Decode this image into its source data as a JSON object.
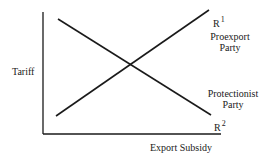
{
  "diagram": {
    "type": "line-diagram",
    "y_axis_label": "Tariff",
    "x_axis_label": "Export Subsidy",
    "lines": [
      {
        "id": "R1",
        "label_base": "R",
        "label_sup": "1",
        "description": [
          "Proexport",
          "Party"
        ],
        "direction": "ascending"
      },
      {
        "id": "R2",
        "label_base": "R",
        "label_sup": "2",
        "description": [
          "Protectionist",
          "Party"
        ],
        "direction": "descending"
      }
    ],
    "colors": {
      "line": "#1a1a1a",
      "background": "#ffffff"
    }
  }
}
